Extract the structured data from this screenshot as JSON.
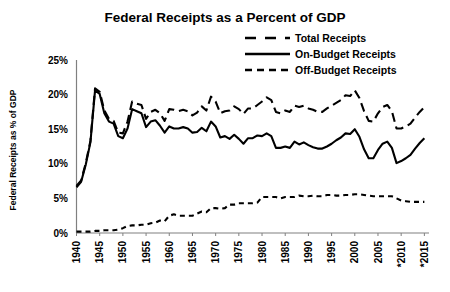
{
  "chart_data": {
    "type": "line",
    "title": "Federal Receipts as a Percent of GDP",
    "xlabel": "",
    "ylabel": "Federal Receipts as % of GDP",
    "ylim": [
      0,
      25
    ],
    "xlim": [
      1940,
      2016
    ],
    "grid": false,
    "legend_position": "top-right",
    "ytick_labels": [
      "0%",
      "5%",
      "10%",
      "15%",
      "20%",
      "25%"
    ],
    "ytick_values": [
      0,
      5,
      10,
      15,
      20,
      25
    ],
    "xtick_labels": [
      "1940",
      "1945",
      "1950",
      "1955",
      "1960",
      "1965",
      "1970",
      "1975",
      "1980",
      "1985",
      "1990",
      "1995",
      "2000",
      "2005",
      "*2010",
      "*2015"
    ],
    "xtick_values": [
      1940,
      1945,
      1950,
      1955,
      1960,
      1965,
      1970,
      1975,
      1980,
      1985,
      1990,
      1995,
      2000,
      2005,
      2010,
      2015
    ],
    "footnote_marker": "*",
    "x": [
      1940,
      1941,
      1942,
      1943,
      1944,
      1945,
      1946,
      1947,
      1948,
      1949,
      1950,
      1951,
      1952,
      1953,
      1954,
      1955,
      1956,
      1957,
      1958,
      1959,
      1960,
      1961,
      1962,
      1963,
      1964,
      1965,
      1966,
      1967,
      1968,
      1969,
      1970,
      1971,
      1972,
      1973,
      1974,
      1975,
      1976,
      1977,
      1978,
      1979,
      1980,
      1981,
      1982,
      1983,
      1984,
      1985,
      1986,
      1987,
      1988,
      1989,
      1990,
      1991,
      1992,
      1993,
      1994,
      1995,
      1996,
      1997,
      1998,
      1999,
      2000,
      2001,
      2002,
      2003,
      2004,
      2005,
      2006,
      2007,
      2008,
      2009,
      2010,
      2011,
      2012,
      2013,
      2014,
      2015
    ],
    "series": [
      {
        "name": "Total Receipts",
        "style": "long-dash",
        "values": [
          6.8,
          7.6,
          10.1,
          13.3,
          20.9,
          20.4,
          17.7,
          16.5,
          16.2,
          14.5,
          14.4,
          16.1,
          19.0,
          18.7,
          18.5,
          16.5,
          17.5,
          17.8,
          17.3,
          16.2,
          17.9,
          17.8,
          17.6,
          17.8,
          17.6,
          17.0,
          17.4,
          18.3,
          17.7,
          19.7,
          19.0,
          17.3,
          17.6,
          17.7,
          18.3,
          17.9,
          17.2,
          18.0,
          18.0,
          18.5,
          19.0,
          19.6,
          19.2,
          17.5,
          17.3,
          17.7,
          17.5,
          18.4,
          18.2,
          18.4,
          18.0,
          17.8,
          17.5,
          17.5,
          18.0,
          18.4,
          18.8,
          19.2,
          19.9,
          19.8,
          20.6,
          19.5,
          17.6,
          16.2,
          16.1,
          17.3,
          18.2,
          18.5,
          17.6,
          15.1,
          15.1,
          15.4,
          15.8,
          16.7,
          17.5,
          18.2
        ]
      },
      {
        "name": "On-Budget Receipts",
        "style": "solid",
        "values": [
          6.6,
          7.4,
          9.9,
          13.1,
          20.6,
          20.1,
          17.3,
          16.1,
          15.8,
          14.0,
          13.7,
          15.1,
          17.9,
          17.6,
          17.3,
          15.3,
          16.1,
          16.3,
          15.5,
          14.5,
          15.4,
          15.1,
          15.1,
          15.3,
          15.1,
          14.5,
          14.6,
          15.2,
          14.7,
          16.1,
          15.4,
          13.8,
          14.0,
          13.6,
          14.2,
          13.6,
          12.9,
          13.7,
          13.7,
          14.1,
          14.0,
          14.4,
          14.0,
          12.3,
          12.3,
          12.5,
          12.3,
          13.2,
          12.8,
          13.1,
          12.7,
          12.4,
          12.2,
          12.2,
          12.5,
          12.9,
          13.4,
          13.8,
          14.4,
          14.3,
          15.0,
          13.9,
          12.1,
          10.8,
          10.8,
          12.0,
          12.9,
          13.2,
          12.3,
          10.1,
          10.4,
          10.8,
          11.3,
          12.2,
          13.0,
          13.7
        ]
      },
      {
        "name": "Off-Budget Receipts",
        "style": "short-dash",
        "values": [
          0.2,
          0.2,
          0.2,
          0.2,
          0.3,
          0.3,
          0.4,
          0.4,
          0.4,
          0.5,
          0.7,
          1.0,
          1.1,
          1.1,
          1.2,
          1.2,
          1.4,
          1.5,
          1.8,
          1.7,
          2.5,
          2.7,
          2.5,
          2.5,
          2.5,
          2.5,
          2.8,
          3.1,
          3.0,
          3.6,
          3.6,
          3.5,
          3.6,
          4.1,
          4.1,
          4.3,
          4.3,
          4.3,
          4.3,
          4.4,
          5.2,
          5.2,
          5.2,
          5.2,
          5.0,
          5.2,
          5.2,
          5.2,
          5.4,
          5.3,
          5.3,
          5.4,
          5.3,
          5.3,
          5.5,
          5.5,
          5.4,
          5.4,
          5.5,
          5.5,
          5.6,
          5.6,
          5.5,
          5.4,
          5.3,
          5.3,
          5.3,
          5.3,
          5.3,
          5.0,
          4.7,
          4.6,
          4.5,
          4.5,
          4.5,
          4.5
        ]
      }
    ],
    "colors": {
      "line": "#000000",
      "axis": "#808080",
      "background": "#ffffff",
      "text": "#000000"
    }
  },
  "legend": {
    "items": [
      {
        "label": "Total Receipts",
        "style": "long-dash"
      },
      {
        "label": "On-Budget Receipts",
        "style": "solid"
      },
      {
        "label": "Off-Budget Receipts",
        "style": "short-dash"
      }
    ]
  }
}
